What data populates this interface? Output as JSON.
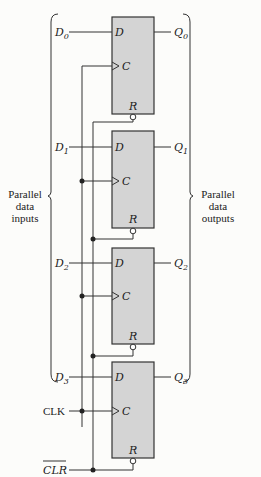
{
  "diagram": {
    "title": "",
    "left_group_label": [
      "Parallel",
      "data",
      "inputs"
    ],
    "right_group_label": [
      "Parallel",
      "data",
      "outputs"
    ],
    "clock_label": "CLK",
    "clear_label": "CLR",
    "flip_flops": [
      {
        "input": "D",
        "input_index": "0",
        "output": "Q",
        "output_index": "0",
        "pin_d": "D",
        "pin_c": "C",
        "pin_r": "R"
      },
      {
        "input": "D",
        "input_index": "1",
        "output": "Q",
        "output_index": "1",
        "pin_d": "D",
        "pin_c": "C",
        "pin_r": "R"
      },
      {
        "input": "D",
        "input_index": "2",
        "output": "Q",
        "output_index": "2",
        "pin_d": "D",
        "pin_c": "C",
        "pin_r": "R"
      },
      {
        "input": "D",
        "input_index": "3",
        "output": "Q",
        "output_index": "3",
        "pin_d": "D",
        "pin_c": "C",
        "pin_r": "R"
      }
    ]
  }
}
